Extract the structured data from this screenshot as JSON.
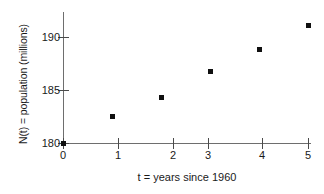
{
  "chart_data": {
    "type": "scatter",
    "title": "",
    "xlabel": "t = years since 1960",
    "ylabel": "N(t) = population (millions)",
    "x": [
      0,
      1,
      2,
      3,
      4,
      5
    ],
    "values": [
      180.0,
      182.5,
      184.3,
      186.7,
      188.8,
      191.1
    ],
    "series": [
      {
        "name": "N(t)",
        "values": [
          180.0,
          182.5,
          184.3,
          186.7,
          188.8,
          191.1
        ]
      }
    ],
    "xlim": [
      0,
      5.8
    ],
    "ylim": [
      180,
      192.3
    ],
    "xticks": [
      "0",
      "1",
      "2",
      "3",
      "4",
      "5"
    ],
    "yticks": [
      "180",
      "185",
      "190"
    ],
    "ytick_values": [
      180,
      185,
      190
    ],
    "xtick_values": [
      0,
      1,
      2,
      3,
      4,
      5
    ],
    "grid": false,
    "legend": false,
    "legend_position": "none",
    "marker_color": "#101010",
    "axis_color": "#6e6e6e",
    "background_color": "#ffffff"
  },
  "axes": {
    "y_axis_label": "N(t) = population (millions)",
    "x_axis_label": "t = years since 1960",
    "y_tick_labels": [
      "190",
      "185",
      "180"
    ],
    "x_tick_labels": [
      "0",
      "1",
      "2",
      "3",
      "4",
      "5"
    ]
  }
}
